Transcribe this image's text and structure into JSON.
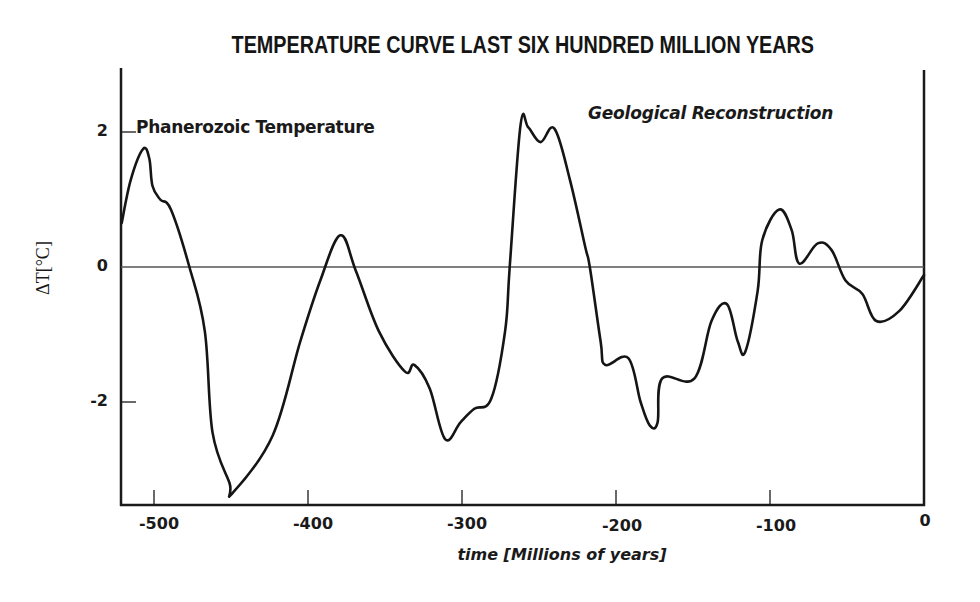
{
  "chart_data": {
    "type": "line",
    "title": "TEMPERATURE CURVE LAST SIX HUNDRED MILLION YEARS",
    "annotations": [
      "Phanerozoic Temperature",
      "Geological Reconstruction"
    ],
    "xlabel": "time [Millions of years]",
    "ylabel": "ΔT[°C]",
    "xlim": [
      -520,
      0
    ],
    "ylim": [
      -3.55,
      2.95
    ],
    "grid": false,
    "reference_line": {
      "y": 0
    },
    "x_ticks": [
      -500,
      -400,
      -300,
      -200,
      -100,
      0
    ],
    "x_tick_labels": [
      "-500",
      "-400",
      "-300",
      "-200",
      "-100",
      "0"
    ],
    "y_ticks": [
      2,
      0,
      -2
    ],
    "y_tick_labels": [
      "2",
      "0",
      "-2"
    ],
    "legend": null,
    "series": [
      {
        "name": "Phanerozoic Temperature",
        "x": [
          -521,
          -515,
          -507,
          -503,
          -501,
          -496,
          -489,
          -477,
          -467,
          -462,
          -451,
          -449,
          -423,
          -405,
          -392,
          -379,
          -369,
          -354,
          -337,
          -331,
          -321,
          -311,
          -301,
          -292,
          -281,
          -272,
          -269,
          -262,
          -257,
          -249,
          -240,
          -230,
          -220,
          -217,
          -210,
          -207,
          -192,
          -184,
          -178,
          -173,
          -170,
          -149,
          -138,
          -128,
          -121,
          -116,
          -108,
          -105,
          -94,
          -86,
          -81,
          -69,
          -60,
          -51,
          -40,
          -31,
          -16,
          0
        ],
        "values": [
          0.65,
          1.3,
          1.75,
          1.6,
          1.2,
          1.0,
          0.85,
          0,
          -0.95,
          -2.45,
          -3.2,
          -3.35,
          -2.5,
          -1.1,
          -0.2,
          0.47,
          -0.05,
          -0.95,
          -1.55,
          -1.45,
          -1.8,
          -2.55,
          -2.3,
          -2.1,
          -1.95,
          -0.95,
          0,
          2.1,
          2.07,
          1.85,
          2.05,
          1.3,
          0.3,
          0,
          -1.1,
          -1.45,
          -1.35,
          -2.0,
          -2.35,
          -2.3,
          -1.65,
          -1.65,
          -0.8,
          -0.55,
          -1.1,
          -1.25,
          -0.35,
          0.4,
          0.85,
          0.55,
          0.05,
          0.35,
          0.25,
          -0.2,
          -0.4,
          -0.8,
          -0.65,
          -0.12
        ]
      }
    ]
  },
  "labels": {
    "title": "TEMPERATURE CURVE LAST SIX HUNDRED MILLION YEARS",
    "annotation_left": "Phanerozoic Temperature",
    "annotation_right": "Geological Reconstruction",
    "ylabel": "ΔT[°C]",
    "xlabel": "time [Millions of years]",
    "yticks": [
      "2",
      "0",
      "-2"
    ],
    "xticks": [
      "-500",
      "-400",
      "-300",
      "-200",
      "-100",
      "0"
    ]
  },
  "colors": {
    "line": "#151515",
    "axis": "#1a1a1a",
    "zero_line": "#555555",
    "background": "#ffffff"
  }
}
